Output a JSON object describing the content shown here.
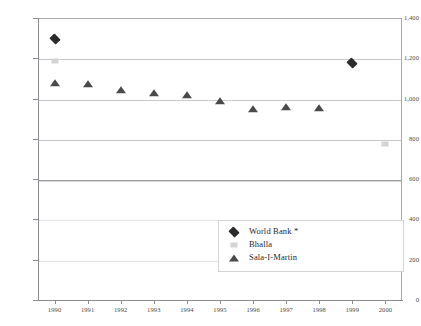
{
  "chart_data": {
    "type": "scatter",
    "title": "",
    "subtitle": "",
    "xlabel": "",
    "ylabel": "",
    "categories": [
      "1990",
      "1991",
      "1992",
      "1993",
      "1994",
      "1995",
      "1996",
      "1997",
      "1998",
      "1999",
      "2000"
    ],
    "ylim": [
      0,
      1400
    ],
    "yticks": [
      0,
      200,
      400,
      600,
      800,
      1000,
      1200,
      1400
    ],
    "ytick_labels": [
      "0",
      "200",
      "400",
      "600",
      "800",
      "1,000",
      "1,200",
      "1,400"
    ],
    "grid": true,
    "legend_position": "bottom-center-right",
    "series": [
      {
        "name": "World Bank *",
        "marker": "diamond",
        "color": "#2b2b2b",
        "x": [
          "1990",
          "1999"
        ],
        "values": [
          1300,
          1180
        ]
      },
      {
        "name": "Bhalla",
        "marker": "square",
        "color": "#d4d4d6",
        "x": [
          "1990",
          "2000"
        ],
        "values": [
          1190,
          780
        ]
      },
      {
        "name": "Sala-I-Martin",
        "marker": "triangle",
        "color": "#4a4a4a",
        "x": [
          "1990",
          "1991",
          "1992",
          "1993",
          "1994",
          "1995",
          "1996",
          "1997",
          "1998"
        ],
        "values": [
          1080,
          1075,
          1050,
          1035,
          1025,
          995,
          955,
          965,
          960
        ]
      }
    ]
  },
  "legend": {
    "items": [
      {
        "label": "World Bank *",
        "marker": "diamond"
      },
      {
        "label": "Bhalla",
        "marker": "square"
      },
      {
        "label": "Sala-I-Martin",
        "marker": "triangle"
      }
    ]
  }
}
